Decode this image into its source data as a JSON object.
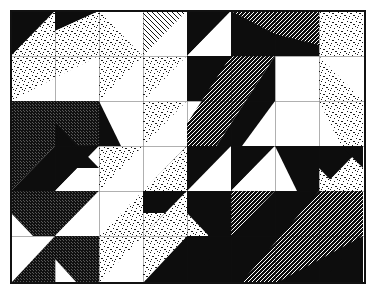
{
  "artwork": {
    "title": "Abstract Geometric Tile Composition",
    "medium": "black-and-white line art",
    "canvas": {
      "width": 378,
      "height": 298,
      "background": "#ffffff"
    },
    "frame": {
      "x": 11,
      "y": 11,
      "width": 354,
      "height": 272,
      "stroke": "#111111",
      "stroke_width": 1.5,
      "fill": "#ffffff"
    },
    "grid": {
      "columns": 8,
      "rows": 6,
      "cell_width": 44.25,
      "cell_height": 45.33,
      "origin_x": 11,
      "origin_y": 11,
      "gridlines_visible": true
    },
    "palette": {
      "black": "#0d0d0d",
      "white": "#ffffff",
      "stipple_ink": "#1a1a1a",
      "hatch_ink": "#141414",
      "outline": "#111111",
      "paper": "#ffffff"
    },
    "fill_types": [
      {
        "id": "black",
        "label": "solid black"
      },
      {
        "id": "white",
        "label": "blank white"
      },
      {
        "id": "stipple",
        "label": "stipple dots"
      },
      {
        "id": "hatch-right",
        "label": "diagonal hatch ascending"
      },
      {
        "id": "hatch-left",
        "label": "diagonal hatch descending"
      },
      {
        "id": "hatch-fine",
        "label": "fine horizontal hatch"
      },
      {
        "id": "crosshatch",
        "label": "dense crosshatch"
      }
    ],
    "shapes": [
      {
        "name": "tri-r0c0-upper-left",
        "points": "11,11 55,11 11,56",
        "fill": "black"
      },
      {
        "name": "tri-r0c0-lower-right",
        "points": "11,56 55,11 55,56",
        "fill": "stipple"
      },
      {
        "name": "band-r0c1-stipple",
        "points": "55,11 99,11 99,56 55,56",
        "fill": "stipple"
      },
      {
        "name": "tri-r0c2-upper",
        "points": "99,11 143,11 143,56",
        "fill": "white"
      },
      {
        "name": "tri-r0c2-lower",
        "points": "99,11 99,56 143,56",
        "fill": "stipple"
      },
      {
        "name": "tri-r0c3-hatch",
        "points": "143,11 187,11 143,56",
        "fill": "hatch-left"
      },
      {
        "name": "tri-r0c3-white",
        "points": "187,11 187,56 143,56",
        "fill": "white"
      },
      {
        "name": "tri-r0c4-black",
        "points": "187,11 231,11 187,56",
        "fill": "black"
      },
      {
        "name": "tri-r0c4-white",
        "points": "231,11 231,56 187,56",
        "fill": "white"
      },
      {
        "name": "tri-r0c5-black",
        "points": "231,11 231,56 187,56",
        "fill": "black"
      },
      {
        "name": "tri-r0c5-hatch",
        "points": "231,11 275,11 231,56",
        "fill": "hatch-fine"
      },
      {
        "name": "tri-r0c6-hatch",
        "points": "275,11 319,11 275,56",
        "fill": "hatch-fine"
      },
      {
        "name": "tri-r0c6-white",
        "points": "319,11 319,56 275,56",
        "fill": "white"
      },
      {
        "name": "tri-r0c7-stipple",
        "points": "319,11 363,11 363,56 319,56",
        "fill": "stipple"
      },
      {
        "name": "tri-r1c0-stipple",
        "points": "11,56 55,56 11,101",
        "fill": "stipple"
      },
      {
        "name": "tri-r1c0-white",
        "points": "55,56 55,101 11,101",
        "fill": "white"
      },
      {
        "name": "tri-r1c1-stipple",
        "points": "55,56 99,56 55,101",
        "fill": "stipple"
      },
      {
        "name": "tri-r1c1-white",
        "points": "99,56 99,101 55,101",
        "fill": "white"
      },
      {
        "name": "tri-r1c2-stipple",
        "points": "99,56 143,56 99,101",
        "fill": "stipple"
      },
      {
        "name": "tri-r1c2-white",
        "points": "143,56 143,101 99,101",
        "fill": "white"
      },
      {
        "name": "tri-r1c3-white",
        "points": "143,56 187,56 143,101",
        "fill": "white"
      },
      {
        "name": "tri-r1c3-hatch",
        "points": "187,56 187,101 143,101",
        "fill": "hatch-fine"
      },
      {
        "name": "big-black-r1c4",
        "points": "187,56 231,56 231,101 187,101",
        "fill": "black"
      },
      {
        "name": "white-square-r1c5-c6",
        "points": "231,56 319,56 319,146 231,146",
        "fill": "white"
      },
      {
        "name": "tri-r1c7-white",
        "points": "319,56 363,56 319,101",
        "fill": "white"
      },
      {
        "name": "tri-r1c7-stipple",
        "points": "319,56 319,101 363,101",
        "fill": "stipple"
      },
      {
        "name": "tri-r2c0-crosshatch",
        "points": "11,101 55,101 55,146 11,146",
        "fill": "crosshatch"
      },
      {
        "name": "tri-r2c1-crosshatch",
        "points": "55,101 99,101 99,146 55,146",
        "fill": "crosshatch"
      },
      {
        "name": "tri-r2c2-stipple",
        "points": "99,101 143,101 99,146",
        "fill": "stipple"
      },
      {
        "name": "tri-r2c2-white",
        "points": "143,101 143,146 99,146",
        "fill": "white"
      },
      {
        "name": "tri-r2c3-hatch",
        "points": "143,101 143,146 187,146",
        "fill": "hatch-left"
      },
      {
        "name": "tri-r2c3-white",
        "points": "143,101 187,101 187,146",
        "fill": "white"
      },
      {
        "name": "diag-band-hatch-fine",
        "points": "231,56 275,56 187,190 143,190",
        "fill": "hatch-fine"
      },
      {
        "name": "tri-r2c7-stipple",
        "points": "319,101 363,101 363,146 319,146",
        "fill": "stipple"
      },
      {
        "name": "tri-r3c0-crosshatch",
        "points": "11,146 55,146 11,191",
        "fill": "crosshatch"
      },
      {
        "name": "tri-r3c0-black",
        "points": "55,146 55,191 11,191",
        "fill": "black"
      },
      {
        "name": "tri-r3c1-black",
        "points": "55,146 99,146 55,191",
        "fill": "black"
      },
      {
        "name": "tri-r3c1-white",
        "points": "99,146 99,191 55,191",
        "fill": "white"
      },
      {
        "name": "tri-r3c2-stipple",
        "points": "99,146 143,146 99,191",
        "fill": "stipple"
      },
      {
        "name": "tri-r3c2-white",
        "points": "143,146 143,191 99,191",
        "fill": "white"
      },
      {
        "name": "tri-r3c3-white",
        "points": "143,146 187,146 143,191",
        "fill": "white"
      },
      {
        "name": "tri-r3c3-stipple",
        "points": "187,146 187,191 143,191",
        "fill": "stipple"
      },
      {
        "name": "tri-r3c4-black",
        "points": "187,146 231,146 187,191",
        "fill": "black"
      },
      {
        "name": "tri-r3c4-white",
        "points": "231,146 231,191 187,191",
        "fill": "white"
      },
      {
        "name": "tri-r3c5-black",
        "points": "231,146 275,146 275,191",
        "fill": "black"
      },
      {
        "name": "tri-r3c5-white",
        "points": "231,146 231,191 275,191",
        "fill": "white"
      },
      {
        "name": "tri-r3c6-black",
        "points": "275,146 319,146 319,191 275,191",
        "fill": "black"
      },
      {
        "name": "tri-r3c7-black",
        "points": "319,146 363,146 319,191",
        "fill": "black"
      },
      {
        "name": "tri-r3c7-white",
        "points": "363,146 363,191 319,191",
        "fill": "white"
      },
      {
        "name": "tri-r4c0-crosshatch",
        "points": "11,191 55,191 55,236 11,236",
        "fill": "crosshatch"
      },
      {
        "name": "tri-r4c1-crosshatch",
        "points": "55,191 99,191 55,236",
        "fill": "crosshatch"
      },
      {
        "name": "tri-r4c1-white",
        "points": "99,191 99,236 55,236",
        "fill": "white"
      },
      {
        "name": "tri-r4c2-white",
        "points": "99,191 143,191 99,236",
        "fill": "white"
      },
      {
        "name": "tri-r4c2-stipple",
        "points": "143,191 143,236 99,236",
        "fill": "stipple"
      },
      {
        "name": "tri-r4c3-black",
        "points": "143,191 187,191 143,236",
        "fill": "black"
      },
      {
        "name": "tri-r4c3-stipple",
        "points": "187,191 187,236 143,236",
        "fill": "stipple"
      },
      {
        "name": "tri-r4c4-black",
        "points": "187,191 231,191 231,236 187,236",
        "fill": "black"
      },
      {
        "name": "tri-r4c5-hatch",
        "points": "231,191 275,191 231,236",
        "fill": "hatch-fine"
      },
      {
        "name": "tri-r4c5-black",
        "points": "275,191 275,236 231,236",
        "fill": "black"
      },
      {
        "name": "tri-r4c6-black",
        "points": "275,191 319,191 319,236 275,236",
        "fill": "black"
      },
      {
        "name": "tri-r4c7-hatch",
        "points": "319,191 363,191 363,236 319,236",
        "fill": "hatch-fine"
      },
      {
        "name": "tri-r5c0-white",
        "points": "11,236 55,236 11,281",
        "fill": "white"
      },
      {
        "name": "tri-r5c0-crosshatch",
        "points": "55,236 55,281 11,281",
        "fill": "crosshatch"
      },
      {
        "name": "tri-r5c1-crosshatch",
        "points": "55,236 99,236 99,281 55,281",
        "fill": "crosshatch"
      },
      {
        "name": "tri-r5c2-stipple",
        "points": "99,236 143,236 99,281",
        "fill": "stipple"
      },
      {
        "name": "tri-r5c2-white",
        "points": "143,236 143,281 99,281",
        "fill": "white"
      },
      {
        "name": "tri-r5c3-stipple",
        "points": "143,236 187,236 143,281",
        "fill": "stipple"
      },
      {
        "name": "tri-r5c3-black",
        "points": "187,236 187,281 143,281",
        "fill": "black"
      },
      {
        "name": "tri-r5c4-black",
        "points": "187,236 231,236 231,281 187,281",
        "fill": "black"
      },
      {
        "name": "tri-r5c5-black",
        "points": "231,236 275,236 275,281 231,281",
        "fill": "black"
      },
      {
        "name": "tri-r5c6-hatch",
        "points": "275,236 319,236 319,281 275,281",
        "fill": "hatch-fine"
      },
      {
        "name": "tri-r5c7-black",
        "points": "319,236 363,236 363,281 319,281",
        "fill": "black"
      }
    ],
    "annotations": {
      "composition_note": "Triangles and squares tiled across an 8x6 grid, each cell split on a diagonal with contrasting textures",
      "texture_count": 7
    }
  }
}
